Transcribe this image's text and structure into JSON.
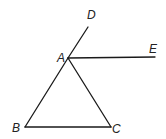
{
  "diagram": {
    "type": "geometry",
    "points": {
      "A": {
        "label": "A",
        "x": 68,
        "y": 58
      },
      "B": {
        "label": "B",
        "x": 25,
        "y": 127
      },
      "C": {
        "label": "C",
        "x": 111,
        "y": 127
      },
      "D": {
        "label": "D",
        "x": 88,
        "y": 27
      },
      "E": {
        "label": "E",
        "x": 155,
        "y": 57
      }
    },
    "segments": [
      "AB",
      "AC",
      "BC",
      "AD",
      "AE"
    ],
    "labels": {
      "A": "A",
      "B": "B",
      "C": "C",
      "D": "D",
      "E": "E"
    }
  }
}
